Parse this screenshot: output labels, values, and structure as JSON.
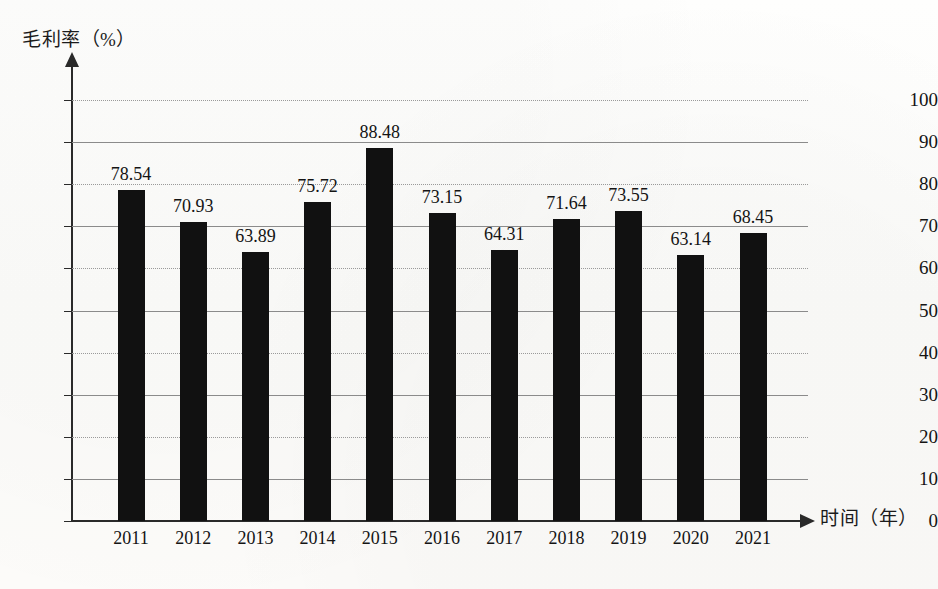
{
  "chart_data": {
    "type": "bar",
    "title": "",
    "ylabel": "毛利率（%）",
    "xlabel": "时间（年）",
    "categories": [
      "2011",
      "2012",
      "2013",
      "2014",
      "2015",
      "2016",
      "2017",
      "2018",
      "2019",
      "2020",
      "2021"
    ],
    "values": [
      78.54,
      70.93,
      63.89,
      75.72,
      88.48,
      73.15,
      64.31,
      71.64,
      73.55,
      63.14,
      68.45
    ],
    "value_labels": [
      "78.54",
      "70.93",
      "63.89",
      "75.72",
      "88.48",
      "73.15",
      "64.31",
      "71.64",
      "73.55",
      "63.14",
      "68.45"
    ],
    "ylim": [
      0,
      100
    ],
    "ytick_values": [
      0,
      10,
      20,
      30,
      40,
      50,
      60,
      70,
      80,
      90,
      100
    ],
    "ytick_labels": [
      "0",
      "10",
      "20",
      "30",
      "40",
      "50",
      "60",
      "70",
      "80",
      "90",
      "100"
    ],
    "grid": true,
    "grid_axis": "y",
    "legend": "none",
    "bar_color": "#111111",
    "axis_color": "#2a2a2a",
    "grid_color": "#8b8b8b",
    "background_color": "#fdfdfb"
  }
}
